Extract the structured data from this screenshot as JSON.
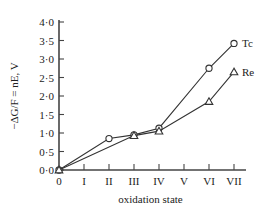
{
  "chart_data": {
    "type": "line",
    "title": "",
    "xlabel": "oxidation state",
    "ylabel": "−ΔG/F = nE, V",
    "categories": [
      "0",
      "I",
      "II",
      "III",
      "IV",
      "V",
      "VI",
      "VII"
    ],
    "x": [
      0,
      1,
      2,
      3,
      4,
      5,
      6,
      7
    ],
    "xlim": [
      0,
      7
    ],
    "ylim": [
      0.0,
      4.0
    ],
    "grid": false,
    "legend_position": "right-inline",
    "ytick_labels": [
      "0·0",
      "0·5",
      "1·0",
      "1·5",
      "2·0",
      "2·5",
      "3·0",
      "3·5",
      "4·0"
    ],
    "ytick_values": [
      0.0,
      0.5,
      1.0,
      1.5,
      2.0,
      2.5,
      3.0,
      3.5,
      4.0
    ],
    "xtick_labels": [
      "0",
      "I",
      "II",
      "III",
      "IV",
      "V",
      "VI",
      "VII"
    ],
    "series": [
      {
        "name": "Tc",
        "marker": "circle",
        "x": [
          0,
          2,
          3,
          4,
          6,
          7
        ],
        "values": [
          0.0,
          0.85,
          0.95,
          1.13,
          2.75,
          3.42
        ]
      },
      {
        "name": "Re",
        "marker": "triangle",
        "x": [
          0,
          3,
          4,
          6,
          7
        ],
        "values": [
          0.0,
          0.93,
          1.05,
          1.85,
          2.65
        ]
      }
    ]
  },
  "axis": {
    "y_title": "−ΔG/F = nE, V",
    "x_title": "oxidation state"
  },
  "legend": {
    "tc_label": "Tc",
    "re_label": "Re"
  }
}
